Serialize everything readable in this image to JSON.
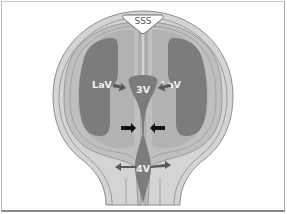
{
  "diagram": {
    "type": "anatomical schematic",
    "labels": {
      "sss": "SSS",
      "lav_left": "LaV",
      "lav_right": "LaV",
      "third_ventricle": "3V",
      "fourth_ventricle": "4V"
    },
    "arrows": [
      {
        "name": "left-lav-to-3v",
        "color": "#5a5a5a"
      },
      {
        "name": "right-lav-to-3v",
        "color": "#5a5a5a"
      },
      {
        "name": "aqueduct-left-compression",
        "color": "#111111"
      },
      {
        "name": "aqueduct-right-compression",
        "color": "#111111"
      },
      {
        "name": "4v-left-outflow",
        "color": "#5a5a5a"
      },
      {
        "name": "4v-right-outflow",
        "color": "#5a5a5a"
      }
    ],
    "colors": {
      "skull": "#d2d2d2",
      "brain": "#bcbcbc",
      "ventricle": "#7a7a7a",
      "outline": "#8c8c8c",
      "background": "#ffffff"
    }
  }
}
